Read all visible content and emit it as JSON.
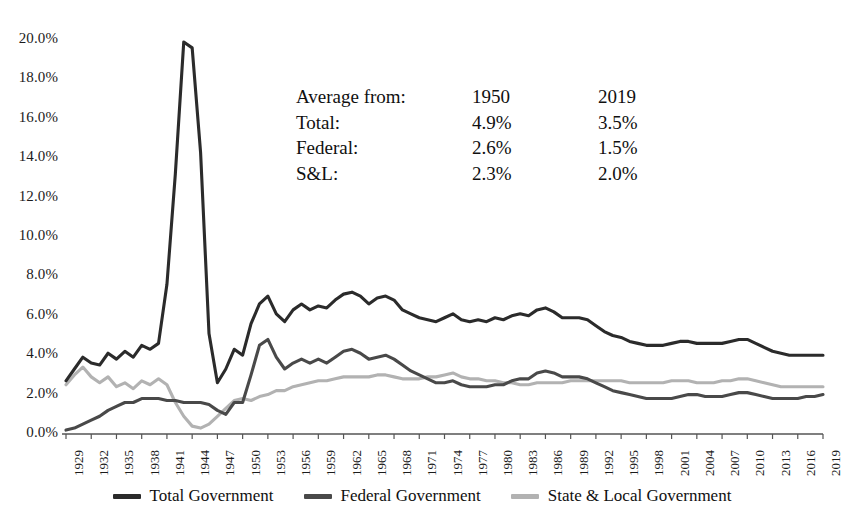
{
  "chart_data": {
    "type": "line",
    "title": "",
    "xlabel": "",
    "ylabel": "",
    "ylim": [
      0,
      20
    ],
    "ytick_step": 2,
    "ytick_labels": [
      "0.0%",
      "2.0%",
      "4.0%",
      "6.0%",
      "8.0%",
      "10.0%",
      "12.0%",
      "14.0%",
      "16.0%",
      "18.0%",
      "20.0%"
    ],
    "xlim": [
      1929,
      2019
    ],
    "xtick_step": 3,
    "xtick_labels": [
      "1929",
      "1932",
      "1935",
      "1938",
      "1941",
      "1944",
      "1947",
      "1950",
      "1953",
      "1956",
      "1959",
      "1962",
      "1965",
      "1968",
      "1971",
      "1974",
      "1977",
      "1980",
      "1983",
      "1986",
      "1989",
      "1992",
      "1995",
      "1998",
      "2001",
      "2004",
      "2007",
      "2010",
      "2013",
      "2016",
      "2019"
    ],
    "grid": false,
    "legend_position": "bottom",
    "x": [
      1929,
      1930,
      1931,
      1932,
      1933,
      1934,
      1935,
      1936,
      1937,
      1938,
      1939,
      1940,
      1941,
      1942,
      1943,
      1944,
      1945,
      1946,
      1947,
      1948,
      1949,
      1950,
      1951,
      1952,
      1953,
      1954,
      1955,
      1956,
      1957,
      1958,
      1959,
      1960,
      1961,
      1962,
      1963,
      1964,
      1965,
      1966,
      1967,
      1968,
      1969,
      1970,
      1971,
      1972,
      1973,
      1974,
      1975,
      1976,
      1977,
      1978,
      1979,
      1980,
      1981,
      1982,
      1983,
      1984,
      1985,
      1986,
      1987,
      1988,
      1989,
      1990,
      1991,
      1992,
      1993,
      1994,
      1995,
      1996,
      1997,
      1998,
      1999,
      2000,
      2001,
      2002,
      2003,
      2004,
      2005,
      2006,
      2007,
      2008,
      2009,
      2010,
      2011,
      2012,
      2013,
      2014,
      2015,
      2016,
      2017,
      2018,
      2019
    ],
    "series": [
      {
        "name": "Total Government",
        "color": "#2b2b2b",
        "values": [
          2.7,
          3.3,
          3.9,
          3.6,
          3.5,
          4.1,
          3.8,
          4.2,
          3.9,
          4.5,
          4.3,
          4.6,
          7.6,
          13.2,
          19.9,
          19.6,
          14.3,
          5.1,
          2.6,
          3.3,
          4.3,
          4.0,
          5.6,
          6.6,
          7.0,
          6.1,
          5.7,
          6.3,
          6.6,
          6.3,
          6.5,
          6.4,
          6.8,
          7.1,
          7.2,
          7.0,
          6.6,
          6.9,
          7.0,
          6.8,
          6.3,
          6.1,
          5.9,
          5.8,
          5.7,
          5.9,
          6.1,
          5.8,
          5.7,
          5.8,
          5.7,
          5.9,
          5.8,
          6.0,
          6.1,
          6.0,
          6.3,
          6.4,
          6.2,
          5.9,
          5.9,
          5.9,
          5.8,
          5.5,
          5.2,
          5.0,
          4.9,
          4.7,
          4.6,
          4.5,
          4.5,
          4.5,
          4.6,
          4.7,
          4.7,
          4.6,
          4.6,
          4.6,
          4.6,
          4.7,
          4.8,
          4.8,
          4.6,
          4.4,
          4.2,
          4.1,
          4.0,
          4.0,
          4.0,
          4.0,
          4.0
        ]
      },
      {
        "name": "Federal Government",
        "color": "#494949",
        "values": [
          0.2,
          0.3,
          0.5,
          0.7,
          0.9,
          1.2,
          1.4,
          1.6,
          1.6,
          1.8,
          1.8,
          1.8,
          1.7,
          1.7,
          1.6,
          1.6,
          1.6,
          1.5,
          1.2,
          1.0,
          1.6,
          1.6,
          3.0,
          4.5,
          4.8,
          3.9,
          3.3,
          3.6,
          3.8,
          3.6,
          3.8,
          3.6,
          3.9,
          4.2,
          4.3,
          4.1,
          3.8,
          3.9,
          4.0,
          3.8,
          3.5,
          3.2,
          3.0,
          2.8,
          2.6,
          2.6,
          2.7,
          2.5,
          2.4,
          2.4,
          2.4,
          2.5,
          2.5,
          2.7,
          2.8,
          2.8,
          3.1,
          3.2,
          3.1,
          2.9,
          2.9,
          2.9,
          2.8,
          2.6,
          2.4,
          2.2,
          2.1,
          2.0,
          1.9,
          1.8,
          1.8,
          1.8,
          1.8,
          1.9,
          2.0,
          2.0,
          1.9,
          1.9,
          1.9,
          2.0,
          2.1,
          2.1,
          2.0,
          1.9,
          1.8,
          1.8,
          1.8,
          1.8,
          1.9,
          1.9,
          2.0
        ]
      },
      {
        "name": "State & Local Government",
        "color": "#b2b2b2",
        "values": [
          2.5,
          3.0,
          3.4,
          2.9,
          2.6,
          2.9,
          2.4,
          2.6,
          2.3,
          2.7,
          2.5,
          2.8,
          2.5,
          1.6,
          0.9,
          0.4,
          0.3,
          0.5,
          0.9,
          1.3,
          1.7,
          1.8,
          1.7,
          1.9,
          2.0,
          2.2,
          2.2,
          2.4,
          2.5,
          2.6,
          2.7,
          2.7,
          2.8,
          2.9,
          2.9,
          2.9,
          2.9,
          3.0,
          3.0,
          2.9,
          2.8,
          2.8,
          2.8,
          2.9,
          2.9,
          3.0,
          3.1,
          2.9,
          2.8,
          2.8,
          2.7,
          2.7,
          2.6,
          2.6,
          2.5,
          2.5,
          2.6,
          2.6,
          2.6,
          2.6,
          2.7,
          2.7,
          2.7,
          2.7,
          2.7,
          2.7,
          2.7,
          2.6,
          2.6,
          2.6,
          2.6,
          2.6,
          2.7,
          2.7,
          2.7,
          2.6,
          2.6,
          2.6,
          2.7,
          2.7,
          2.8,
          2.8,
          2.7,
          2.6,
          2.5,
          2.4,
          2.4,
          2.4,
          2.4,
          2.4,
          2.4
        ]
      }
    ],
    "annotation": {
      "header": {
        "label": "Average from:",
        "col1": "1950",
        "col2": "2019"
      },
      "rows": [
        {
          "label": "Total:",
          "col1": "4.9%",
          "col2": "3.5%"
        },
        {
          "label": "Federal:",
          "col1": "2.6%",
          "col2": "1.5%"
        },
        {
          "label": "S&L:",
          "col1": "2.3%",
          "col2": "2.0%"
        }
      ]
    }
  }
}
